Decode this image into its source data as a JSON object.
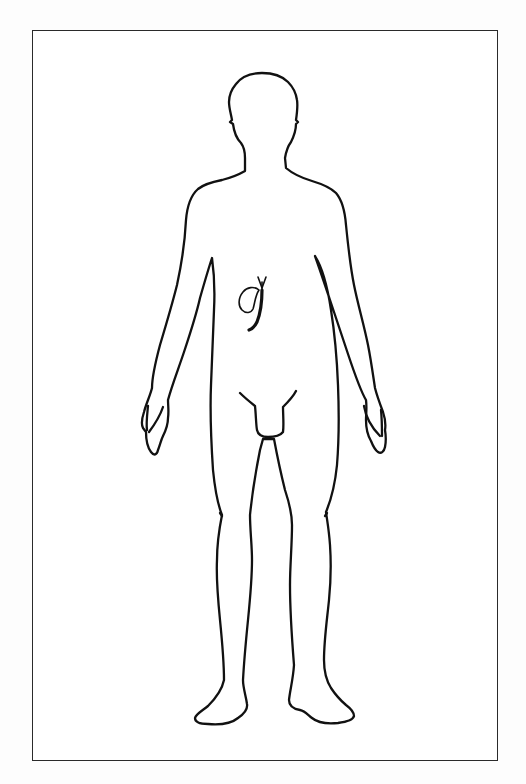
{
  "figure": {
    "highlighted_organ": "gallbladder-and-bile-ducts",
    "stroke_color": "#111111",
    "frame_color": "#2a2a2a",
    "background_color": "#ffffff",
    "description": "Anatomical outline of a male human body, front view, with the gallbladder and bile ducts highlighted in the upper right abdomen"
  }
}
